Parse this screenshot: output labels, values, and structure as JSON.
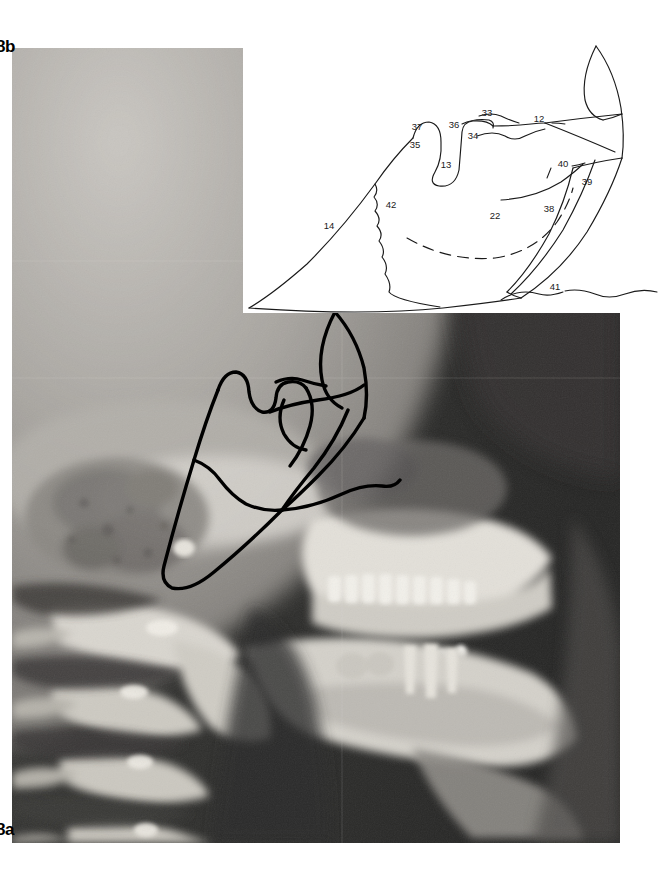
{
  "figure": {
    "type": "anatomical-illustration",
    "panel_labels": {
      "upper": "8b",
      "lower": "8a"
    },
    "colors": {
      "ink": "#1a1a1a",
      "panel_background": "#ffffff",
      "overlay_ink": "#000000",
      "radiograph_dark": "#2b2b2b",
      "radiograph_light": "#d8d6d2"
    },
    "tracing": {
      "title": "",
      "numeric_labels": [
        {
          "id": "12",
          "x": 296,
          "y": 86,
          "name": "label-12"
        },
        {
          "id": "13",
          "x": 203,
          "y": 132,
          "name": "label-13"
        },
        {
          "id": "14",
          "x": 86,
          "y": 193,
          "name": "label-14"
        },
        {
          "id": "22",
          "x": 252,
          "y": 183,
          "name": "label-22"
        },
        {
          "id": "33",
          "x": 244,
          "y": 80,
          "name": "label-33"
        },
        {
          "id": "34",
          "x": 230,
          "y": 103,
          "name": "label-34"
        },
        {
          "id": "35",
          "x": 172,
          "y": 112,
          "name": "label-35"
        },
        {
          "id": "36",
          "x": 211,
          "y": 92,
          "name": "label-36"
        },
        {
          "id": "37",
          "x": 174,
          "y": 94,
          "name": "label-37"
        },
        {
          "id": "38",
          "x": 306,
          "y": 176,
          "name": "label-38"
        },
        {
          "id": "39",
          "x": 344,
          "y": 149,
          "name": "label-39"
        },
        {
          "id": "40",
          "x": 320,
          "y": 131,
          "name": "label-40"
        },
        {
          "id": "41",
          "x": 312,
          "y": 254,
          "name": "label-41"
        },
        {
          "id": "42",
          "x": 148,
          "y": 172,
          "name": "label-42"
        }
      ],
      "leader_lines": [
        {
          "label": "33",
          "name": "leader-33"
        },
        {
          "label": "12",
          "name": "leader-12"
        },
        {
          "label": "41",
          "name": "leader-41"
        },
        {
          "label": "40",
          "name": "leader-40"
        }
      ],
      "features": [
        {
          "name": "mandibular-body-outline",
          "style": "solid"
        },
        {
          "name": "alveolar-crest-outline",
          "style": "solid"
        },
        {
          "name": "mandibular-canal",
          "style": "dashed"
        },
        {
          "name": "symphyseal-suture",
          "style": "wavy"
        },
        {
          "name": "coronoid-process",
          "style": "solid"
        },
        {
          "name": "condylar-process",
          "style": "solid"
        },
        {
          "name": "ramus-posterior-border",
          "style": "solid"
        },
        {
          "name": "gonial-angle",
          "style": "solid"
        }
      ]
    }
  }
}
